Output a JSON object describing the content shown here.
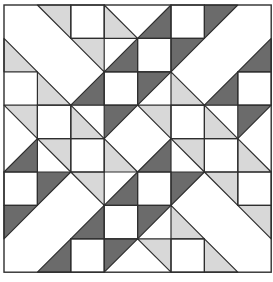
{
  "grid": {
    "cols": 8,
    "rows": 8,
    "origin_x": 4,
    "origin_y": 5,
    "cell": 33.4
  },
  "colors": {
    "light": "#d8d8d8",
    "dark": "#6b6b6b",
    "line": "#2e2e2e",
    "background": "#ffffff"
  },
  "triangles": [
    {
      "fill": "light",
      "pts": [
        [
          1,
          0
        ],
        [
          2,
          0
        ],
        [
          2,
          1
        ]
      ]
    },
    {
      "fill": "light",
      "pts": [
        [
          3,
          0
        ],
        [
          3,
          1
        ],
        [
          4,
          1
        ]
      ]
    },
    {
      "fill": "dark",
      "pts": [
        [
          4,
          1
        ],
        [
          5,
          0
        ],
        [
          5,
          1
        ]
      ]
    },
    {
      "fill": "dark",
      "pts": [
        [
          6,
          0
        ],
        [
          7,
          0
        ],
        [
          6,
          1
        ]
      ]
    },
    {
      "fill": "light",
      "pts": [
        [
          0,
          1
        ],
        [
          0,
          2
        ],
        [
          1,
          2
        ]
      ]
    },
    {
      "fill": "light",
      "pts": [
        [
          2,
          1
        ],
        [
          3,
          1
        ],
        [
          3,
          2
        ]
      ]
    },
    {
      "fill": "dark",
      "pts": [
        [
          3,
          2
        ],
        [
          4,
          1
        ],
        [
          4,
          2
        ]
      ]
    },
    {
      "fill": "dark",
      "pts": [
        [
          5,
          1
        ],
        [
          6,
          1
        ],
        [
          5,
          2
        ]
      ]
    },
    {
      "fill": "dark",
      "pts": [
        [
          7,
          2
        ],
        [
          8,
          1
        ],
        [
          8,
          2
        ]
      ]
    },
    {
      "fill": "light",
      "pts": [
        [
          1,
          2
        ],
        [
          1,
          3
        ],
        [
          2,
          3
        ]
      ]
    },
    {
      "fill": "dark",
      "pts": [
        [
          2,
          3
        ],
        [
          3,
          2
        ],
        [
          3,
          3
        ]
      ]
    },
    {
      "fill": "dark",
      "pts": [
        [
          4,
          2
        ],
        [
          5,
          2
        ],
        [
          4,
          3
        ]
      ]
    },
    {
      "fill": "light",
      "pts": [
        [
          5,
          2
        ],
        [
          5,
          3
        ],
        [
          6,
          3
        ]
      ]
    },
    {
      "fill": "dark",
      "pts": [
        [
          6,
          3
        ],
        [
          7,
          2
        ],
        [
          7,
          3
        ]
      ]
    },
    {
      "fill": "light",
      "pts": [
        [
          0,
          3
        ],
        [
          1,
          3
        ],
        [
          1,
          4
        ]
      ]
    },
    {
      "fill": "light",
      "pts": [
        [
          2,
          3
        ],
        [
          2,
          4
        ],
        [
          3,
          4
        ]
      ]
    },
    {
      "fill": "dark",
      "pts": [
        [
          3,
          3
        ],
        [
          4,
          3
        ],
        [
          3,
          4
        ]
      ]
    },
    {
      "fill": "light",
      "pts": [
        [
          4,
          3
        ],
        [
          5,
          3
        ],
        [
          5,
          4
        ]
      ]
    },
    {
      "fill": "light",
      "pts": [
        [
          6,
          3
        ],
        [
          6,
          4
        ],
        [
          7,
          4
        ]
      ]
    },
    {
      "fill": "dark",
      "pts": [
        [
          7,
          3
        ],
        [
          8,
          3
        ],
        [
          7,
          4
        ]
      ]
    },
    {
      "fill": "dark",
      "pts": [
        [
          0,
          5
        ],
        [
          1,
          4
        ],
        [
          1,
          5
        ]
      ]
    },
    {
      "fill": "light",
      "pts": [
        [
          1,
          4
        ],
        [
          2,
          4
        ],
        [
          2,
          5
        ]
      ]
    },
    {
      "fill": "light",
      "pts": [
        [
          3,
          4
        ],
        [
          3,
          5
        ],
        [
          4,
          5
        ]
      ]
    },
    {
      "fill": "dark",
      "pts": [
        [
          4,
          5
        ],
        [
          5,
          4
        ],
        [
          5,
          5
        ]
      ]
    },
    {
      "fill": "light",
      "pts": [
        [
          5,
          4
        ],
        [
          6,
          4
        ],
        [
          6,
          5
        ]
      ]
    },
    {
      "fill": "light",
      "pts": [
        [
          7,
          4
        ],
        [
          7,
          5
        ],
        [
          8,
          5
        ]
      ]
    },
    {
      "fill": "dark",
      "pts": [
        [
          1,
          5
        ],
        [
          2,
          5
        ],
        [
          1,
          6
        ]
      ]
    },
    {
      "fill": "light",
      "pts": [
        [
          2,
          5
        ],
        [
          3,
          5
        ],
        [
          3,
          6
        ]
      ]
    },
    {
      "fill": "dark",
      "pts": [
        [
          3,
          6
        ],
        [
          4,
          5
        ],
        [
          4,
          6
        ]
      ]
    },
    {
      "fill": "dark",
      "pts": [
        [
          5,
          5
        ],
        [
          6,
          5
        ],
        [
          5,
          6
        ]
      ]
    },
    {
      "fill": "light",
      "pts": [
        [
          6,
          5
        ],
        [
          7,
          5
        ],
        [
          7,
          6
        ]
      ]
    },
    {
      "fill": "dark",
      "pts": [
        [
          0,
          6
        ],
        [
          1,
          6
        ],
        [
          0,
          7
        ]
      ]
    },
    {
      "fill": "dark",
      "pts": [
        [
          2,
          7
        ],
        [
          3,
          6
        ],
        [
          3,
          7
        ]
      ]
    },
    {
      "fill": "dark",
      "pts": [
        [
          4,
          6
        ],
        [
          5,
          6
        ],
        [
          4,
          7
        ]
      ]
    },
    {
      "fill": "light",
      "pts": [
        [
          5,
          6
        ],
        [
          5,
          7
        ],
        [
          6,
          7
        ]
      ]
    },
    {
      "fill": "light",
      "pts": [
        [
          7,
          6
        ],
        [
          8,
          6
        ],
        [
          8,
          7
        ]
      ]
    },
    {
      "fill": "dark",
      "pts": [
        [
          1,
          8
        ],
        [
          2,
          7
        ],
        [
          2,
          8
        ]
      ]
    },
    {
      "fill": "dark",
      "pts": [
        [
          3,
          7
        ],
        [
          4,
          7
        ],
        [
          3,
          8
        ]
      ]
    },
    {
      "fill": "light",
      "pts": [
        [
          4,
          7
        ],
        [
          5,
          7
        ],
        [
          5,
          8
        ]
      ]
    },
    {
      "fill": "light",
      "pts": [
        [
          6,
          7
        ],
        [
          6,
          8
        ],
        [
          7,
          8
        ]
      ]
    }
  ],
  "white_squares": [
    [
      2,
      0
    ],
    [
      5,
      0
    ],
    [
      4,
      1
    ],
    [
      3,
      2
    ],
    [
      7,
      2
    ],
    [
      1,
      3
    ],
    [
      5,
      3
    ],
    [
      2,
      4
    ],
    [
      6,
      4
    ],
    [
      0,
      5
    ],
    [
      4,
      5
    ],
    [
      7,
      5
    ],
    [
      3,
      6
    ],
    [
      2,
      7
    ],
    [
      5,
      7
    ]
  ],
  "caption": ""
}
